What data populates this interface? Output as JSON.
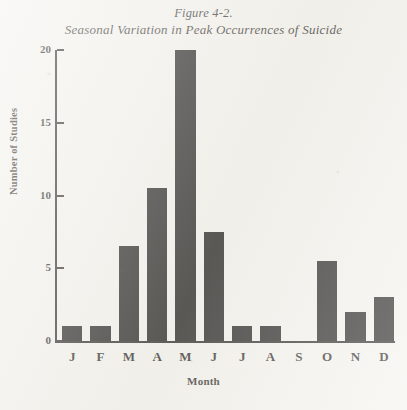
{
  "figure": {
    "number": "Figure 4-2.",
    "caption": "Seasonal Variation in Peak Occurrences of Suicide"
  },
  "chart_data": {
    "type": "bar",
    "title": "Seasonal Variation in Peak Occurrences of Suicide",
    "subtitle": "Figure 4-2.",
    "categories": [
      "J",
      "F",
      "M",
      "A",
      "M",
      "J",
      "J",
      "A",
      "S",
      "O",
      "N",
      "D"
    ],
    "category_names": [
      "January",
      "February",
      "March",
      "April",
      "May",
      "June",
      "July",
      "August",
      "September",
      "October",
      "November",
      "December"
    ],
    "values": [
      1,
      1,
      6.5,
      10.5,
      20,
      7.5,
      1,
      1,
      0,
      5.5,
      2,
      3
    ],
    "xlabel": "Month",
    "ylabel": "Number of Studies",
    "ylim": [
      0,
      20
    ],
    "yticks": [
      0,
      5,
      10,
      15,
      20
    ],
    "ytick_labels": [
      "0",
      "5",
      "10",
      "15",
      "20"
    ],
    "grid": false,
    "legend": null,
    "bar_color": "#0b0a09",
    "axis_color": "#15130f",
    "background_color": "#f2f1ec"
  }
}
